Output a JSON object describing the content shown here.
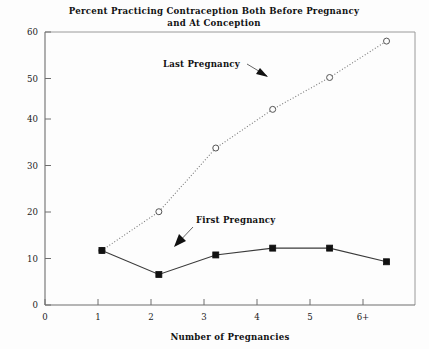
{
  "chart_data": {
    "type": "line",
    "title": "Percent Practicing Contraception Both Before Pregnancy and At Conception",
    "title_line1": "Percent Practicing Contraception Both Before Pregnancy",
    "title_line2": "and At Conception",
    "xlabel": "Number of Pregnancies",
    "ylabel": "",
    "categories": [
      "1",
      "2",
      "3",
      "4",
      "5",
      "6+"
    ],
    "x_tick_labels": [
      "0",
      "1",
      "2",
      "3",
      "4",
      "5",
      "6+"
    ],
    "y_tick_labels": [
      "0",
      "10",
      "20",
      "30",
      "40",
      "50",
      "60"
    ],
    "xlim": [
      0,
      6.5
    ],
    "ylim": [
      0,
      60
    ],
    "grid": false,
    "legend": "annotations",
    "series": [
      {
        "name": "First Pregnancy",
        "marker": "filled-square",
        "line_style": "solid",
        "color": "#111111",
        "x": [
          1,
          2,
          3,
          4,
          5,
          6
        ],
        "values": [
          12,
          6.7,
          11,
          12.5,
          12.5,
          9.5
        ]
      },
      {
        "name": "Last Pregnancy",
        "marker": "open-circle",
        "line_style": "dotted",
        "color": "#555555",
        "x": [
          1,
          2,
          3,
          4,
          5,
          6
        ],
        "values": [
          12,
          20.5,
          34.5,
          43,
          50,
          58
        ]
      }
    ],
    "annotations": [
      {
        "text": "Last Pregnancy",
        "target_series": "Last Pregnancy"
      },
      {
        "text": "First Pregnancy",
        "target_series": "First Pregnancy"
      }
    ]
  },
  "colors": {
    "background": "#fdfdfd",
    "axis": "#6e6e6e",
    "frame": "#9a9a9a",
    "first_series": "#111111",
    "last_series": "#555555",
    "text": "#111111"
  }
}
